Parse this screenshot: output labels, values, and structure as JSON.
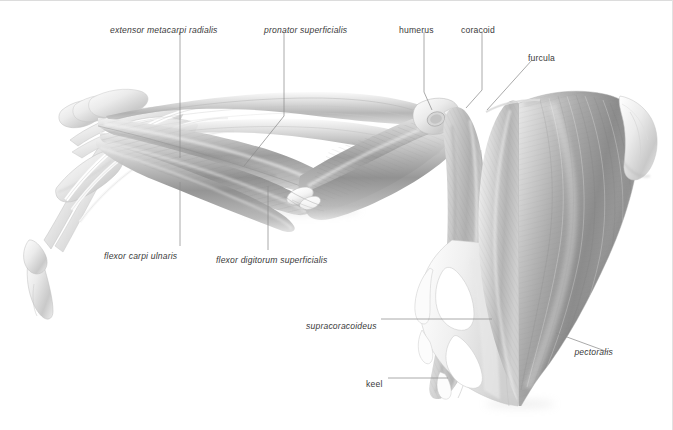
{
  "figure": {
    "style": "grayscale graphite anatomical illustration",
    "background_color": "#ffffff",
    "ink_color": "#3a3a3a",
    "leader_color": "#8e8e8e",
    "border_color": "#dcdcdc"
  },
  "labels": [
    {
      "id": "extensor-metacarpi-radialis",
      "text": "extensor metacarpi radialis",
      "style": "italic",
      "x": 110,
      "y": 26,
      "kind": "muscle"
    },
    {
      "id": "pronator-superficialis",
      "text": "pronator superficialis",
      "style": "italic",
      "x": 264,
      "y": 26,
      "kind": "muscle"
    },
    {
      "id": "humerus",
      "text": "humerus",
      "style": "upright",
      "x": 399,
      "y": 26,
      "kind": "bone"
    },
    {
      "id": "coracoid",
      "text": "coracoid",
      "style": "upright",
      "x": 461,
      "y": 26,
      "kind": "bone"
    },
    {
      "id": "furcula",
      "text": "furcula",
      "style": "upright",
      "x": 528,
      "y": 54,
      "kind": "bone"
    },
    {
      "id": "flexor-carpi-ulnaris",
      "text": "flexor carpi ulnaris",
      "style": "italic",
      "x": 104,
      "y": 252,
      "kind": "muscle"
    },
    {
      "id": "flexor-digitorum-superficialis",
      "text": "flexor digitorum superficialis",
      "style": "italic",
      "x": 216,
      "y": 256,
      "kind": "muscle"
    },
    {
      "id": "supracoracoideus",
      "text": "supracoracoideus",
      "style": "italic",
      "x": 306,
      "y": 322,
      "kind": "muscle"
    },
    {
      "id": "pectoralis",
      "text": "pectoralis",
      "style": "italic",
      "x": 613,
      "y": 348,
      "kind": "muscle"
    },
    {
      "id": "keel",
      "text": "keel",
      "style": "upright",
      "x": 366,
      "y": 380,
      "kind": "bone"
    }
  ],
  "leaders": [
    {
      "id": "leader-extensor-metacarpi-radialis",
      "path": "M 180 32 L 180 158"
    },
    {
      "id": "leader-pronator-superficialis",
      "path": "M 284 32 L 284 116 L 244 166"
    },
    {
      "id": "leader-humerus",
      "path": "M 424 32 L 424 92 L 432 110"
    },
    {
      "id": "leader-coracoid",
      "path": "M 482 32 L 482 90 L 466 108"
    },
    {
      "id": "leader-furcula",
      "path": "M 532 60 L 487 110"
    },
    {
      "id": "leader-flexor-carpi-ulnaris",
      "path": "M 180 246 L 180 182"
    },
    {
      "id": "leader-flexor-digitorum-superficialis",
      "path": "M 268 250 L 268 186"
    },
    {
      "id": "leader-supracoracoideus",
      "path": "M 381 319 L 492 319"
    },
    {
      "id": "leader-pectoralis",
      "path": "M 608 352 L 556 333"
    },
    {
      "id": "leader-keel",
      "path": "M 388 378 L 448 378"
    }
  ]
}
